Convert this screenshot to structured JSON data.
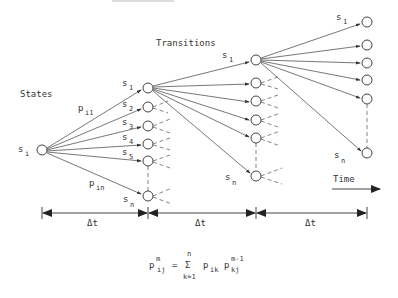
{
  "diagram": {
    "title_states": "States",
    "title_transitions": "Transitions",
    "time_label": "Time",
    "start_state": {
      "base": "s",
      "sub": "i"
    },
    "prob_labels": [
      {
        "base": "p",
        "sub": "i1"
      },
      {
        "base": "p",
        "sub": "in"
      }
    ],
    "column2_labels": [
      {
        "base": "s",
        "sub": "1"
      },
      {
        "base": "s",
        "sub": "2"
      },
      {
        "base": "s",
        "sub": "3"
      },
      {
        "base": "s",
        "sub": "4"
      },
      {
        "base": "s",
        "sub": "5"
      },
      {
        "base": "s",
        "sub": "n"
      }
    ],
    "column3_labels": [
      {
        "base": "s",
        "sub": "1"
      },
      {
        "base": "s",
        "sub": "n"
      }
    ],
    "column4_labels": [
      {
        "base": "s",
        "sub": "1"
      },
      {
        "base": "s",
        "sub": "n"
      }
    ],
    "interval_labels": [
      "Δt",
      "Δt",
      "Δt"
    ],
    "formula": {
      "lhs_base": "p",
      "lhs_sub": "ij",
      "lhs_sup": "m",
      "equals": "=",
      "sum_symbol": "Σ",
      "sum_upper": "n",
      "sum_lower": "k=1",
      "term1_base": "p",
      "term1_sub": "ik",
      "term2_base": "p",
      "term2_sub": "kj",
      "term2_sup": "m-1"
    }
  }
}
